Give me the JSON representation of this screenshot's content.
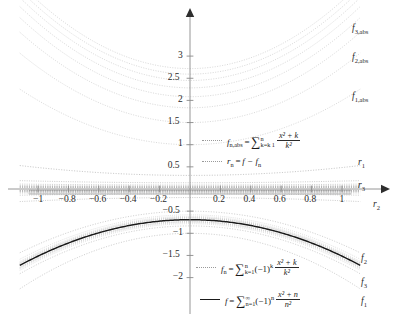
{
  "chart_data": {
    "type": "line",
    "title": "",
    "xlabel": "",
    "ylabel": "",
    "xlim": [
      -1.08,
      1.08
    ],
    "ylim": [
      -2.25,
      3.35
    ],
    "grid": false,
    "legend_position": "center",
    "x_ticks": [
      "-1",
      "-0.8",
      "-0.6",
      "-0.4",
      "-0.2",
      "0.2",
      "0.4",
      "0.6",
      "0.8",
      "1"
    ],
    "x_tick_values": [
      -1,
      -0.8,
      -0.6,
      -0.4,
      -0.2,
      0.2,
      0.4,
      0.6,
      0.8,
      1
    ],
    "y_ticks": [
      "3",
      "2.5",
      "2",
      "1.5",
      "1",
      "0.5",
      "-0.5",
      "-1",
      "-1.5",
      "-2"
    ],
    "y_tick_values": [
      3,
      2.5,
      2,
      1.5,
      1,
      0.5,
      -0.5,
      -1,
      -1.5,
      -2
    ],
    "series": [
      {
        "name": "f_1,abs",
        "kind": "abs_partial",
        "n": 1,
        "label": "f",
        "sub": "1,abs",
        "color": "#b8b8b8",
        "style": "dotted"
      },
      {
        "name": "f_2,abs",
        "kind": "abs_partial",
        "n": 2,
        "label": "f",
        "sub": "2,abs",
        "color": "#b8b8b8",
        "style": "dotted"
      },
      {
        "name": "f_3,abs",
        "kind": "abs_partial",
        "n": 3,
        "label": "f",
        "sub": "3,abs",
        "color": "#b8b8b8",
        "style": "dotted"
      },
      {
        "name": "f_1",
        "kind": "alt_partial",
        "n": 1,
        "label": "f",
        "sub": "1",
        "color": "#b0b0b0",
        "style": "dotted"
      },
      {
        "name": "f_2",
        "kind": "alt_partial",
        "n": 2,
        "label": "f",
        "sub": "2",
        "color": "#b0b0b0",
        "style": "dotted"
      },
      {
        "name": "f_3",
        "kind": "alt_partial",
        "n": 3,
        "label": "f",
        "sub": "3",
        "color": "#b0b0b0",
        "style": "dotted"
      },
      {
        "name": "f",
        "kind": "limit",
        "label": "f",
        "sub": "",
        "color": "#1a1a1a",
        "style": "solid"
      },
      {
        "name": "r_1",
        "kind": "remainder",
        "n": 1,
        "label": "r",
        "sub": "1",
        "color": "#9a9a9a",
        "style": "dotted"
      },
      {
        "name": "r_2",
        "kind": "remainder",
        "n": 2,
        "label": "r",
        "sub": "2",
        "color": "#9a9a9a",
        "style": "dotted"
      },
      {
        "name": "r_3",
        "kind": "remainder",
        "n": 3,
        "label": "r",
        "sub": "3",
        "color": "#9a9a9a",
        "style": "dotted"
      }
    ],
    "curve_labels": [
      {
        "text_label": "f",
        "sub": "3,abs",
        "x_px": 352,
        "y_px": 24
      },
      {
        "text_label": "f",
        "sub": "2,abs",
        "x_px": 352,
        "y_px": 53
      },
      {
        "text_label": "f",
        "sub": "1,abs",
        "x_px": 352,
        "y_px": 92
      },
      {
        "text_label": "r",
        "sub": "1",
        "x_px": 358,
        "y_px": 158
      },
      {
        "text_label": "r",
        "sub": "3",
        "x_px": 358,
        "y_px": 181
      },
      {
        "text_label": "r",
        "sub": "2",
        "x_px": 373,
        "y_px": 200
      },
      {
        "text_label": "f",
        "sub": "2",
        "x_px": 361,
        "y_px": 254
      },
      {
        "text_label": "f",
        "sub": "3",
        "x_px": 361,
        "y_px": 278
      },
      {
        "text_label": "f",
        "sub": "1",
        "x_px": 361,
        "y_px": 297
      }
    ],
    "legend_entries": [
      {
        "id": "f-n-abs",
        "style": "dotted",
        "lhs": "f",
        "lhs_sub": "n,abs",
        "eq": "=",
        "sigma": "∑",
        "sigma_upper": "n",
        "sigma_lower": "k 1",
        "sigma_lower_prefix": "k=",
        "numerator": "x² + k",
        "denominator": "k²",
        "factor": ""
      },
      {
        "id": "r-n",
        "style": "dotted",
        "lhs": "r",
        "lhs_sub": "n",
        "eq": "=",
        "rhs": "f − f",
        "rhs_sub": "n"
      },
      {
        "id": "f-n",
        "style": "dotted",
        "lhs": "f",
        "lhs_sub": "n",
        "eq": "=",
        "sigma": "∑",
        "sigma_upper": "n",
        "sigma_lower_prefix": "k=",
        "sigma_lower": "1",
        "factor": "(−1)",
        "factor_sup": "k",
        "numerator": "x² + k",
        "denominator": "k²"
      },
      {
        "id": "f-limit",
        "style": "solid",
        "lhs": "f",
        "lhs_sub": "",
        "eq": "=",
        "sigma": "∑",
        "sigma_upper": "∞",
        "sigma_lower_prefix": "n=",
        "sigma_lower": "1",
        "factor": "(−1)",
        "factor_sup": "n",
        "numerator": "x² + n",
        "denominator": "n²"
      }
    ],
    "axis": {
      "x_axis_arrow": "right",
      "y_axis_arrow": "up",
      "origin_px": [
        190,
        189
      ]
    },
    "colors": {
      "curve_light": "#b8b8b8",
      "curve_main": "#1a1a1a",
      "axis": "#7d7d7d",
      "text": "#2a2a2a"
    }
  }
}
